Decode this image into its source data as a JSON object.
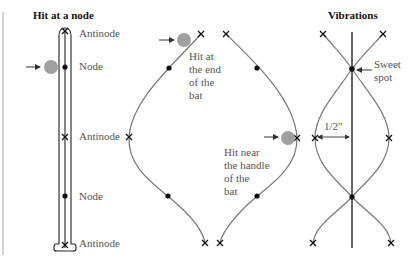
{
  "panels": {
    "node": {
      "title": "Hit at a node",
      "labels": [
        "Antinode",
        "Node",
        "Antinode",
        "Node",
        "Antinode"
      ]
    },
    "end": {
      "hit_end_label": "Hit at\nthe end\nof the\nbat",
      "hit_handle_label": "Hit near\nthe handle\nof the\nbat"
    },
    "vibrations": {
      "title": "Vibrations",
      "sweet_spot_label": "Sweet\nspot",
      "distance_label": "1/2\""
    }
  },
  "colors": {
    "line": "#111111",
    "curve": "#777777",
    "ball": "#a0a0a0",
    "text": "#555555",
    "margin_rule": "#aaaaaa"
  }
}
